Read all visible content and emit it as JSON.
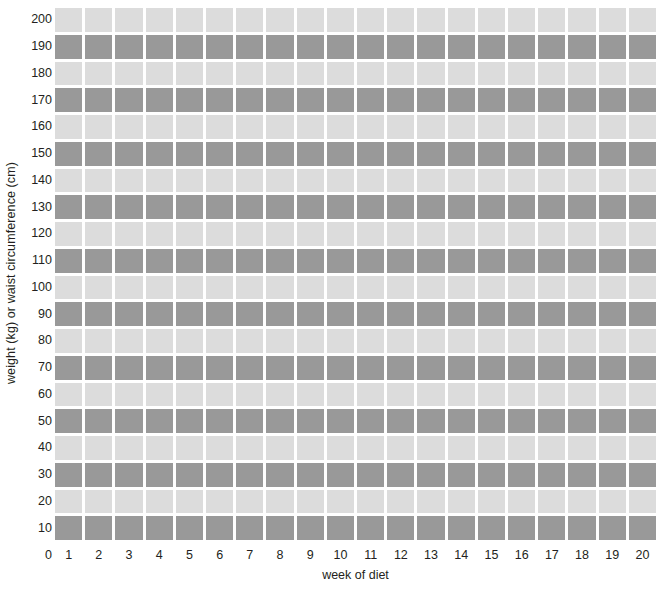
{
  "chart_data": {
    "type": "heatmap",
    "title": "",
    "xlabel": "week of diet",
    "ylabel": "weight (kg) or waist circumference (cm)",
    "xlim": [
      0,
      20
    ],
    "ylim": [
      0,
      200
    ],
    "grid": false,
    "legend": "none",
    "x_tick_labels": [
      "1",
      "2",
      "3",
      "4",
      "5",
      "6",
      "7",
      "8",
      "9",
      "10",
      "11",
      "12",
      "13",
      "14",
      "15",
      "16",
      "17",
      "18",
      "19",
      "20"
    ],
    "x_zero_label": "0",
    "y_tick_labels": [
      "200",
      "190",
      "180",
      "170",
      "160",
      "150",
      "140",
      "130",
      "120",
      "110",
      "100",
      "90",
      "80",
      "70",
      "60",
      "50",
      "40",
      "30",
      "20",
      "10"
    ],
    "y_tick_values": [
      200,
      190,
      180,
      170,
      160,
      150,
      140,
      130,
      120,
      110,
      100,
      90,
      80,
      70,
      60,
      50,
      40,
      30,
      20,
      10
    ],
    "categories": [
      "1",
      "2",
      "3",
      "4",
      "5",
      "6",
      "7",
      "8",
      "9",
      "10",
      "11",
      "12",
      "13",
      "14",
      "15",
      "16",
      "17",
      "18",
      "19",
      "20"
    ],
    "row_bands": [
      {
        "value": 200,
        "shade": "light"
      },
      {
        "value": 190,
        "shade": "dark"
      },
      {
        "value": 180,
        "shade": "light"
      },
      {
        "value": 170,
        "shade": "dark"
      },
      {
        "value": 160,
        "shade": "light"
      },
      {
        "value": 150,
        "shade": "dark"
      },
      {
        "value": 140,
        "shade": "light"
      },
      {
        "value": 130,
        "shade": "dark"
      },
      {
        "value": 120,
        "shade": "light"
      },
      {
        "value": 110,
        "shade": "dark"
      },
      {
        "value": 100,
        "shade": "light"
      },
      {
        "value": 90,
        "shade": "dark"
      },
      {
        "value": 80,
        "shade": "light"
      },
      {
        "value": 70,
        "shade": "dark"
      },
      {
        "value": 60,
        "shade": "light"
      },
      {
        "value": 50,
        "shade": "dark"
      },
      {
        "value": 40,
        "shade": "light"
      },
      {
        "value": 30,
        "shade": "dark"
      },
      {
        "value": 20,
        "shade": "light"
      },
      {
        "value": 10,
        "shade": "dark"
      }
    ],
    "values": [
      [
        200,
        200,
        200,
        200,
        200,
        200,
        200,
        200,
        200,
        200,
        200,
        200,
        200,
        200,
        200,
        200,
        200,
        200,
        200,
        200
      ],
      [
        190,
        190,
        190,
        190,
        190,
        190,
        190,
        190,
        190,
        190,
        190,
        190,
        190,
        190,
        190,
        190,
        190,
        190,
        190,
        190
      ],
      [
        180,
        180,
        180,
        180,
        180,
        180,
        180,
        180,
        180,
        180,
        180,
        180,
        180,
        180,
        180,
        180,
        180,
        180,
        180,
        180
      ],
      [
        170,
        170,
        170,
        170,
        170,
        170,
        170,
        170,
        170,
        170,
        170,
        170,
        170,
        170,
        170,
        170,
        170,
        170,
        170,
        170
      ],
      [
        160,
        160,
        160,
        160,
        160,
        160,
        160,
        160,
        160,
        160,
        160,
        160,
        160,
        160,
        160,
        160,
        160,
        160,
        160,
        160
      ],
      [
        150,
        150,
        150,
        150,
        150,
        150,
        150,
        150,
        150,
        150,
        150,
        150,
        150,
        150,
        150,
        150,
        150,
        150,
        150,
        150
      ],
      [
        140,
        140,
        140,
        140,
        140,
        140,
        140,
        140,
        140,
        140,
        140,
        140,
        140,
        140,
        140,
        140,
        140,
        140,
        140,
        140
      ],
      [
        130,
        130,
        130,
        130,
        130,
        130,
        130,
        130,
        130,
        130,
        130,
        130,
        130,
        130,
        130,
        130,
        130,
        130,
        130,
        130
      ],
      [
        120,
        120,
        120,
        120,
        120,
        120,
        120,
        120,
        120,
        120,
        120,
        120,
        120,
        120,
        120,
        120,
        120,
        120,
        120,
        120
      ],
      [
        110,
        110,
        110,
        110,
        110,
        110,
        110,
        110,
        110,
        110,
        110,
        110,
        110,
        110,
        110,
        110,
        110,
        110,
        110,
        110
      ],
      [
        100,
        100,
        100,
        100,
        100,
        100,
        100,
        100,
        100,
        100,
        100,
        100,
        100,
        100,
        100,
        100,
        100,
        100,
        100,
        100
      ],
      [
        90,
        90,
        90,
        90,
        90,
        90,
        90,
        90,
        90,
        90,
        90,
        90,
        90,
        90,
        90,
        90,
        90,
        90,
        90,
        90
      ],
      [
        80,
        80,
        80,
        80,
        80,
        80,
        80,
        80,
        80,
        80,
        80,
        80,
        80,
        80,
        80,
        80,
        80,
        80,
        80,
        80
      ],
      [
        70,
        70,
        70,
        70,
        70,
        70,
        70,
        70,
        70,
        70,
        70,
        70,
        70,
        70,
        70,
        70,
        70,
        70,
        70,
        70
      ],
      [
        60,
        60,
        60,
        60,
        60,
        60,
        60,
        60,
        60,
        60,
        60,
        60,
        60,
        60,
        60,
        60,
        60,
        60,
        60,
        60
      ],
      [
        50,
        50,
        50,
        50,
        50,
        50,
        50,
        50,
        50,
        50,
        50,
        50,
        50,
        50,
        50,
        50,
        50,
        50,
        50,
        50
      ],
      [
        40,
        40,
        40,
        40,
        40,
        40,
        40,
        40,
        40,
        40,
        40,
        40,
        40,
        40,
        40,
        40,
        40,
        40,
        40,
        40
      ],
      [
        30,
        30,
        30,
        30,
        30,
        30,
        30,
        30,
        30,
        30,
        30,
        30,
        30,
        30,
        30,
        30,
        30,
        30,
        30,
        30
      ],
      [
        20,
        20,
        20,
        20,
        20,
        20,
        20,
        20,
        20,
        20,
        20,
        20,
        20,
        20,
        20,
        20,
        20,
        20,
        20,
        20
      ],
      [
        10,
        10,
        10,
        10,
        10,
        10,
        10,
        10,
        10,
        10,
        10,
        10,
        10,
        10,
        10,
        10,
        10,
        10,
        10,
        10
      ]
    ]
  },
  "colors": {
    "light_band": "#dcdcdc",
    "dark_band": "#999999",
    "background": "#ffffff",
    "separator": "#ffffff",
    "text": "#231f20"
  }
}
